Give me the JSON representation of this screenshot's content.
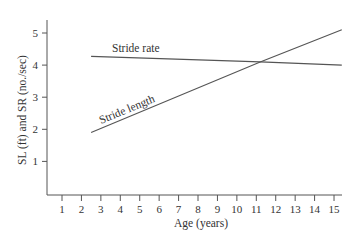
{
  "chart_data": {
    "type": "line",
    "title": "",
    "xlabel": "Age (years)",
    "ylabel": "SL (ft) and SR (no./sec)",
    "xlim": [
      0,
      15.4
    ],
    "ylim": [
      0,
      5.5
    ],
    "xticks": [
      1,
      2,
      3,
      4,
      5,
      6,
      7,
      8,
      9,
      10,
      11,
      12,
      13,
      14,
      15
    ],
    "yticks": [
      1,
      2,
      3,
      4,
      5
    ],
    "grid": false,
    "legend": "inline labels on lines",
    "series": [
      {
        "name": "Stride rate",
        "x": [
          2.5,
          11.2,
          15.4
        ],
        "y": [
          4.27,
          4.1,
          4.0
        ]
      },
      {
        "name": "Stride length",
        "x": [
          2.5,
          11.2,
          15.4
        ],
        "y": [
          1.9,
          4.1,
          5.1
        ]
      }
    ],
    "annotations": [
      "Stride rate",
      "Stride length"
    ],
    "line_color": "#555555"
  },
  "labels": {
    "xlabel": "Age (years)",
    "ylabel": "SL (ft) and SR (no./sec)",
    "stride_rate": "Stride rate",
    "stride_length": "Stride length"
  }
}
